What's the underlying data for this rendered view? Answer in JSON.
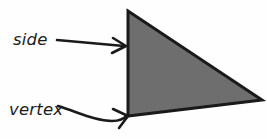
{
  "figure": {
    "background_color": "#fefefe",
    "shape": {
      "name": "triangle",
      "fill_color": "#6e6e6e",
      "stroke_color": "#1a1a1a",
      "stroke_width": 3,
      "vertices": [
        {
          "x": 128,
          "y": 11
        },
        {
          "x": 262,
          "y": 100
        },
        {
          "x": 128,
          "y": 116
        }
      ]
    },
    "annotations": [
      {
        "id": "side",
        "label": "side",
        "label_x": 13,
        "label_y": 45,
        "leader_path": "M 57,40 L 124,46",
        "arrow_head": "M 113,38 L 126,46 L 112,53",
        "target_x": 127,
        "target_y": 46,
        "stroke_color": "#1a1a1a"
      },
      {
        "id": "vertex",
        "label": "vertex",
        "label_x": 9,
        "label_y": 115,
        "leader_path": "M 58,106 C 80,113 96,121 112,121 C 120,121 124,119 127,115",
        "arrow_head": "M 113,109 L 128,116 L 119,128",
        "target_x": 128,
        "target_y": 116,
        "stroke_color": "#1a1a1a"
      }
    ]
  }
}
